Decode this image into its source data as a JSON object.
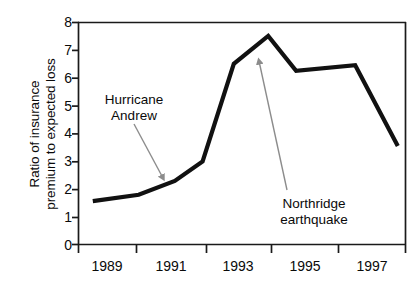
{
  "chart_data": {
    "type": "line",
    "title": "",
    "xlabel": "",
    "ylabel": "Ratio of insurance premium to expected loss",
    "ylabel_line1": "Ratio of insurance",
    "ylabel_line2": "premium to expected loss",
    "xlim": [
      1988.0,
      1998.0
    ],
    "ylim": [
      0,
      8
    ],
    "yticks": [
      0,
      1,
      2,
      3,
      4,
      5,
      6,
      7,
      8
    ],
    "ytick_labels": [
      "0",
      "1",
      "2",
      "3",
      "4",
      "5",
      "6",
      "7",
      "8"
    ],
    "xtick_positions": [
      1988.0,
      1989.75,
      1991.9,
      1993.9,
      1995.9,
      1998.0
    ],
    "xtick_labels": [
      "1989",
      "1991",
      "1993",
      "1995",
      "1997"
    ],
    "grid": false,
    "legend": false,
    "series": [
      {
        "name": "Ratio of insurance premium to expected loss",
        "color": "#111111",
        "x": [
          1988.45,
          1989.85,
          1990.95,
          1991.8,
          1992.75,
          1993.8,
          1994.65,
          1996.45,
          1997.75
        ],
        "values": [
          1.57,
          1.8,
          2.3,
          3.0,
          6.5,
          7.5,
          6.25,
          6.45,
          3.55
        ]
      }
    ],
    "annotations": [
      {
        "name": "hurricane-andrew",
        "text_line1": "Hurricane",
        "text_line2": "Andrew",
        "arrow_color": "#8c8c8c",
        "points_to_x": 1990.9,
        "points_to_y": 2.3
      },
      {
        "name": "northridge-earthquake",
        "text_line1": "Northridge",
        "text_line2": "earthquake",
        "arrow_color": "#8c8c8c",
        "points_to_x": 1993.75,
        "points_to_y": 7.2
      }
    ],
    "axis_color": "#1a1a1a",
    "background": "#ffffff"
  }
}
